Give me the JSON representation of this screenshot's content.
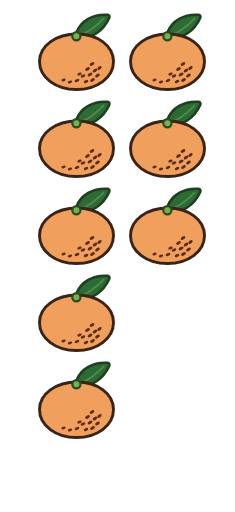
{
  "scene": {
    "title": "Oranges counting illustration",
    "background_color": "#FFFFFF",
    "width": 235,
    "height": 512,
    "item_name": "orange",
    "item_plural": "oranges",
    "total_count": 8,
    "count_label": "8"
  },
  "palette": {
    "body_fill": "#F0A05C",
    "body_outline": "#3A2317",
    "leaf_fill": "#2D6B34",
    "leaf_outline": "#1E3F20",
    "leaf_vein": "#4F8A4F",
    "stem_fill": "#72B24F",
    "stem_outline": "#2B4A22",
    "speckle": "#5A2A10"
  },
  "layout": {
    "columns": 2,
    "rows": 5,
    "row_spacing": 87,
    "column_x": [
      31,
      122
    ],
    "row_y": [
      12,
      99,
      186,
      273,
      360
    ]
  },
  "items": [
    {
      "id": 1,
      "label": "orange-1",
      "row": 1,
      "col": 1,
      "x": 31,
      "y": 12
    },
    {
      "id": 2,
      "label": "orange-2",
      "row": 1,
      "col": 2,
      "x": 122,
      "y": 12
    },
    {
      "id": 3,
      "label": "orange-3",
      "row": 2,
      "col": 1,
      "x": 31,
      "y": 99
    },
    {
      "id": 4,
      "label": "orange-4",
      "row": 2,
      "col": 2,
      "x": 122,
      "y": 99
    },
    {
      "id": 5,
      "label": "orange-5",
      "row": 3,
      "col": 1,
      "x": 31,
      "y": 186
    },
    {
      "id": 6,
      "label": "orange-6",
      "row": 3,
      "col": 2,
      "x": 122,
      "y": 186
    },
    {
      "id": 7,
      "label": "orange-7",
      "row": 4,
      "col": 1,
      "x": 31,
      "y": 273
    },
    {
      "id": 8,
      "label": "orange-8",
      "row": 5,
      "col": 1,
      "x": 31,
      "y": 360
    }
  ],
  "speckles": [
    {
      "cx": 61.0,
      "cy": 52.0,
      "r": 1.9,
      "rot": -32
    },
    {
      "cx": 56.5,
      "cy": 57.0,
      "r": 1.9,
      "rot": -30
    },
    {
      "cx": 64.0,
      "cy": 58.5,
      "r": 1.9,
      "rot": -35
    },
    {
      "cx": 59.0,
      "cy": 62.5,
      "r": 1.9,
      "rot": -28
    },
    {
      "cx": 66.5,
      "cy": 63.5,
      "r": 1.9,
      "rot": -33
    },
    {
      "cx": 52.0,
      "cy": 64.0,
      "r": 1.8,
      "rot": -25
    },
    {
      "cx": 61.5,
      "cy": 68.0,
      "r": 1.9,
      "rot": -30
    },
    {
      "cx": 55.0,
      "cy": 69.5,
      "r": 1.8,
      "rot": -27
    },
    {
      "cx": 46.0,
      "cy": 68.5,
      "r": 1.8,
      "rot": -22
    },
    {
      "cx": 39.0,
      "cy": 70.0,
      "r": 1.7,
      "rot": -18
    },
    {
      "cx": 32.5,
      "cy": 68.0,
      "r": 1.6,
      "rot": -15
    },
    {
      "cx": 48.5,
      "cy": 62.0,
      "r": 1.7,
      "rot": -24
    },
    {
      "cx": 68.5,
      "cy": 56.0,
      "r": 1.8,
      "rot": -35
    }
  ]
}
